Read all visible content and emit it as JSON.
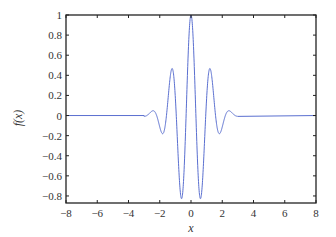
{
  "chart_data": {
    "type": "line",
    "title": "",
    "xlabel": "x",
    "ylabel": "f(x)",
    "xlim": [
      -8,
      8
    ],
    "ylim": [
      -0.87,
      1.0
    ],
    "xticks": [
      -8,
      -6,
      -4,
      -2,
      0,
      2,
      4,
      6,
      8
    ],
    "xtick_labels": [
      "−8",
      "−6",
      "−4",
      "−2",
      "0",
      "2",
      "4",
      "6",
      "8"
    ],
    "yticks": [
      1,
      0.8,
      0.6,
      0.4,
      0.2,
      0,
      -0.2,
      -0.4,
      -0.6,
      -0.8
    ],
    "ytick_labels": [
      "1",
      "0.8",
      "0.6",
      "0.4",
      "0.2",
      "0",
      "−0.2",
      "−0.4",
      "−0.6",
      "−0.8"
    ],
    "grid": false,
    "legend": null,
    "series": [
      {
        "name": "f(x)",
        "color": "#5a6fd0",
        "formula": "cos(5x)*exp(-x^2/2)",
        "x_range": [
          -3,
          3
        ],
        "key_points": [
          {
            "x": -8,
            "y": 0
          },
          {
            "x": -3,
            "y": 0
          },
          {
            "x": -2.51,
            "y": 0.04
          },
          {
            "x": -1.88,
            "y": -0.17
          },
          {
            "x": -1.26,
            "y": 0.45
          },
          {
            "x": -0.63,
            "y": -0.82
          },
          {
            "x": 0,
            "y": 1.0
          },
          {
            "x": 0.63,
            "y": -0.82
          },
          {
            "x": 1.26,
            "y": 0.45
          },
          {
            "x": 1.88,
            "y": -0.17
          },
          {
            "x": 2.51,
            "y": 0.04
          },
          {
            "x": 3,
            "y": 0
          },
          {
            "x": 8,
            "y": 0
          }
        ]
      }
    ]
  },
  "colors": {
    "axis": "#222222",
    "line": "#5a6fd0",
    "text": "#333333"
  }
}
